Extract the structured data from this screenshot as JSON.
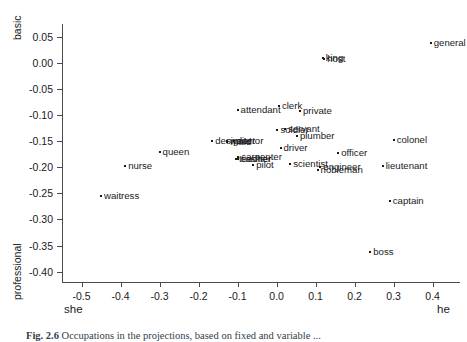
{
  "chart_data": {
    "type": "scatter",
    "title": "",
    "xlabel": "",
    "ylabel": "",
    "xlim": [
      -0.55,
      0.47
    ],
    "ylim": [
      -0.42,
      0.075
    ],
    "grid": false,
    "legend": null,
    "axis_endpoint_labels": {
      "x_left": "she",
      "x_right": "he",
      "y_top": "basic",
      "y_bottom": "professional"
    },
    "xticks": [
      -0.5,
      -0.4,
      -0.3,
      -0.2,
      -0.1,
      0.0,
      0.1,
      0.2,
      0.3,
      0.4
    ],
    "xticklabels": [
      "-0.5",
      "-0.4",
      "-0.3",
      "-0.2",
      "-0.1",
      "0.0",
      "0.1",
      "0.2",
      "0.3",
      "0.4"
    ],
    "yticks": [
      0.05,
      0.0,
      -0.05,
      -0.1,
      -0.15,
      -0.2,
      -0.25,
      -0.3,
      -0.35,
      -0.4
    ],
    "yticklabels": [
      "0.05",
      "0.00",
      "-0.05",
      "-0.10",
      "-0.15",
      "-0.20",
      "-0.25",
      "-0.30",
      "-0.35",
      "-0.40"
    ],
    "point_color": "#1a1a1a",
    "points": [
      {
        "label": "general",
        "x": 0.395,
        "y": 0.038
      },
      {
        "label": "king",
        "x": 0.118,
        "y": 0.01
      },
      {
        "label": "host",
        "x": 0.122,
        "y": 0.008
      },
      {
        "label": "clerk",
        "x": 0.006,
        "y": -0.082
      },
      {
        "label": "private",
        "x": 0.06,
        "y": -0.092
      },
      {
        "label": "attendant",
        "x": -0.1,
        "y": -0.09
      },
      {
        "label": "soldier",
        "x": 0.002,
        "y": -0.128
      },
      {
        "label": "servant",
        "x": 0.022,
        "y": -0.127
      },
      {
        "label": "plumber",
        "x": 0.052,
        "y": -0.139
      },
      {
        "label": "designer",
        "x": -0.165,
        "y": -0.15
      },
      {
        "label": "waiter",
        "x": -0.128,
        "y": -0.15
      },
      {
        "label": "maid",
        "x": -0.126,
        "y": -0.151
      },
      {
        "label": "doctor",
        "x": -0.11,
        "y": -0.149
      },
      {
        "label": "queen",
        "x": -0.3,
        "y": -0.17
      },
      {
        "label": "driver",
        "x": 0.01,
        "y": -0.162
      },
      {
        "label": "officer",
        "x": 0.158,
        "y": -0.173
      },
      {
        "label": "colonel",
        "x": 0.3,
        "y": -0.148
      },
      {
        "label": "carpenter",
        "x": -0.098,
        "y": -0.18
      },
      {
        "label": "teacher",
        "x": -0.104,
        "y": -0.184
      },
      {
        "label": "cashier",
        "x": -0.1,
        "y": -0.184
      },
      {
        "label": "pilot",
        "x": -0.06,
        "y": -0.196
      },
      {
        "label": "scientist",
        "x": 0.035,
        "y": -0.194
      },
      {
        "label": "engineer",
        "x": 0.112,
        "y": -0.199
      },
      {
        "label": "nobleman",
        "x": 0.105,
        "y": -0.206
      },
      {
        "label": "nurse",
        "x": -0.388,
        "y": -0.197
      },
      {
        "label": "lieutenant",
        "x": 0.272,
        "y": -0.198
      },
      {
        "label": "waitress",
        "x": -0.45,
        "y": -0.255
      },
      {
        "label": "captain",
        "x": 0.29,
        "y": -0.265
      },
      {
        "label": "boss",
        "x": 0.24,
        "y": -0.362
      }
    ]
  },
  "caption": {
    "figure_number": "Fig. 2.6",
    "text": "Occupations in the projections, based on fixed and variable ..."
  }
}
